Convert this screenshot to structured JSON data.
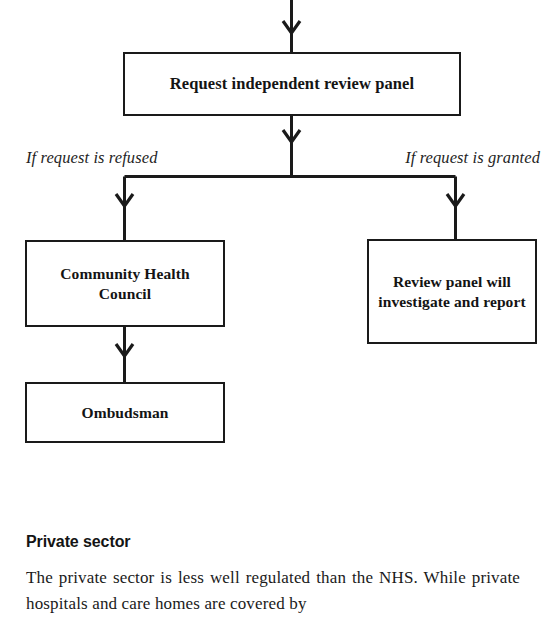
{
  "diagram": {
    "type": "flowchart",
    "nodes": [
      {
        "id": "request-panel",
        "label": "Request independent review panel"
      },
      {
        "id": "community-health-council",
        "label": "Community Health Council"
      },
      {
        "id": "review-panel",
        "label": "Review panel will investigate and report"
      },
      {
        "id": "ombudsman",
        "label": "Ombudsman"
      }
    ],
    "branch_labels": {
      "left": "If request is refused",
      "right": "If request is granted"
    },
    "edges": [
      {
        "from": "incoming",
        "to": "request-panel",
        "label": ""
      },
      {
        "from": "request-panel",
        "to": "community-health-council",
        "label": "If request is refused"
      },
      {
        "from": "request-panel",
        "to": "review-panel",
        "label": "If request is granted"
      },
      {
        "from": "community-health-council",
        "to": "ombudsman",
        "label": ""
      }
    ],
    "stroke_color": "#1a1a1a",
    "fill_color": "#ffffff"
  },
  "text_section": {
    "heading": "Private sector",
    "paragraph": "The private sector is less well regulated than the NHS. While private hospitals and care homes are covered by"
  }
}
